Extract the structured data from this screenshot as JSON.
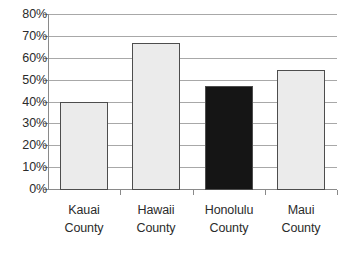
{
  "chart_data": {
    "type": "bar",
    "title": "",
    "subtitle": "",
    "xlabel": "",
    "ylabel": "",
    "categories": [
      "Kauai County",
      "Hawaii County",
      "Honolulu County",
      "Maui County"
    ],
    "category_lines": [
      [
        "Kauai",
        "County"
      ],
      [
        "Hawaii",
        "County"
      ],
      [
        "Honolulu",
        "County"
      ],
      [
        "Maui",
        "County"
      ]
    ],
    "values": [
      40,
      67,
      47.5,
      55
    ],
    "value_labels": [
      "40%",
      "67%",
      "47.5%",
      "55%"
    ],
    "series": [
      {
        "name": "",
        "values": [
          40,
          67,
          47.5,
          55
        ]
      }
    ],
    "ylim": [
      0,
      80
    ],
    "ytick_step": 10,
    "ytick_values": [
      80,
      70,
      60,
      50,
      40,
      30,
      20,
      10,
      0
    ],
    "ytick_labels": [
      "80%",
      "70%",
      "60%",
      "50%",
      "40%",
      "30%",
      "20%",
      "10%",
      "0%"
    ],
    "grid": true,
    "grid_axis": "y",
    "legend": false,
    "legend_position": "none",
    "bar_colors": [
      "#ebebeb",
      "#ebebeb",
      "#151515",
      "#ebebeb"
    ],
    "bar_border_color": "#4d4d4d",
    "highlighted_category": "Honolulu County",
    "colors": {
      "background": "#ffffff",
      "gridline": "#a8a8a8",
      "axis": "#8a8a8a",
      "text": "#2b2b2b",
      "bar_light": "#ebebeb",
      "bar_dark": "#151515"
    }
  }
}
